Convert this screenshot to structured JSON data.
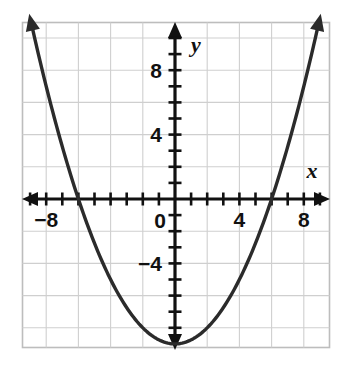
{
  "chart_data": {
    "type": "line",
    "title": "",
    "subtitle": "",
    "xlabel": "x",
    "ylabel": "y",
    "xlim": [
      -10,
      10
    ],
    "ylim": [
      -11,
      11
    ],
    "grid": true,
    "grid_step": 2,
    "tick_step": 1,
    "legend": "none",
    "x_tick_labels": [
      "-8",
      "4",
      "8"
    ],
    "y_tick_labels": [
      "8",
      "4",
      "-4"
    ],
    "origin_label": "0",
    "x_axis_labels": [
      {
        "value": -8,
        "text": "−8"
      },
      {
        "value": 4,
        "text": "4"
      },
      {
        "value": 8,
        "text": "8"
      }
    ],
    "y_axis_labels": [
      {
        "value": 8,
        "text": "8"
      },
      {
        "value": 4,
        "text": "4"
      },
      {
        "value": -4,
        "text": "−4"
      }
    ],
    "series": [
      {
        "name": "parabola",
        "equation": "y = (x^2 - 36) / 4",
        "vertex": [
          0,
          -9
        ],
        "roots": [
          -6,
          6
        ],
        "color": "#2b2b2b",
        "x": [
          -10,
          -9,
          -8,
          -7,
          -6,
          -5,
          -4,
          -3,
          -2,
          -1,
          0,
          1,
          2,
          3,
          4,
          5,
          6,
          7,
          8,
          9,
          10
        ],
        "values": [
          16,
          11.25,
          7,
          3.25,
          0,
          -2.75,
          -5,
          -6.75,
          -8,
          -8.75,
          -9,
          -8.75,
          -8,
          -6.75,
          -5,
          -2.75,
          0,
          3.25,
          7,
          11.25,
          16
        ]
      }
    ],
    "colors": {
      "curve": "#2b2b2b",
      "axis": "#111111",
      "grid": "#cfcfcf",
      "frame": "#bdbdbd",
      "background": "#ffffff",
      "label": "#111111"
    }
  },
  "figure": {
    "axis_x_name": "x",
    "axis_y_name": "y",
    "origin_text": "0"
  }
}
